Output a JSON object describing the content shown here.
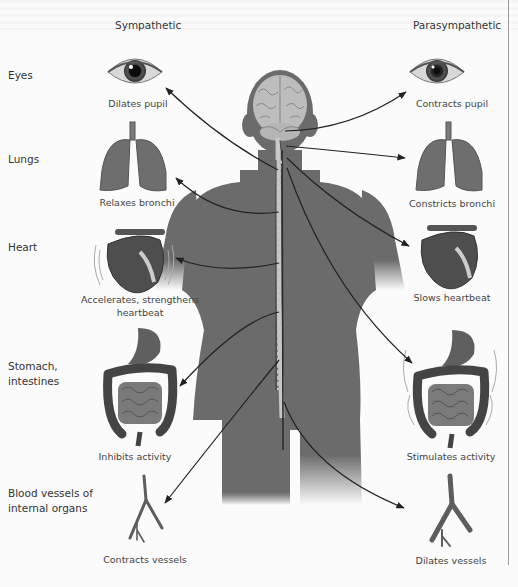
{
  "columns": {
    "left": "Sympathetic",
    "right": "Parasympathetic"
  },
  "organs": [
    {
      "id": "eyes",
      "label": "Eyes",
      "sympathetic": "Dilates pupil",
      "parasympathetic": "Contracts pupil"
    },
    {
      "id": "lungs",
      "label": "Lungs",
      "sympathetic": "Relaxes bronchi",
      "parasympathetic": "Constricts bronchi"
    },
    {
      "id": "heart",
      "label": "Heart",
      "sympathetic": "Accelerates, strengthens heartbeat",
      "parasympathetic": "Slows heartbeat"
    },
    {
      "id": "stomach",
      "label": "Stomach, intestines",
      "sympathetic": "Inhibits activity",
      "parasympathetic": "Stimulates activity"
    },
    {
      "id": "vessels",
      "label": "Blood vessels of internal organs",
      "sympathetic": "Contracts vessels",
      "parasympathetic": "Dilates vessels"
    }
  ],
  "labels": {
    "eyes": "Eyes",
    "lungs": "Lungs",
    "heart": "Heart",
    "stomach_line1": "Stomach,",
    "stomach_line2": "intestines",
    "vessels_line1": "Blood vessels of",
    "vessels_line2": "internal organs"
  },
  "effects": {
    "sym_eyes": "Dilates pupil",
    "sym_lungs": "Relaxes bronchi",
    "sym_heart_line1": "Accelerates, strengthens",
    "sym_heart_line2": "heartbeat",
    "sym_stomach": "Inhibits activity",
    "sym_vessels": "Contracts vessels",
    "para_eyes": "Contracts pupil",
    "para_lungs": "Constricts bronchi",
    "para_heart": "Slows heartbeat",
    "para_stomach": "Stimulates activity",
    "para_vessels": "Dilates vessels"
  },
  "colors": {
    "body": "#6b6b6b",
    "organ": "#6e6e6e",
    "organ_dark": "#4a4a4a",
    "arrow": "#222222",
    "background": "#fbfbfb"
  }
}
